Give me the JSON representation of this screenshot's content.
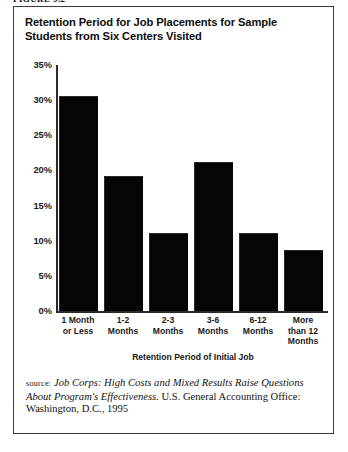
{
  "figure": {
    "label": "Figure 9.2"
  },
  "chart_title_line1": "Retention Period for Job Placements for Sample Students from",
  "chart_title_line2": "Six Centers Visited",
  "source": {
    "prefix": "source:",
    "italic_title": "Job Corps: High Costs and Mixed Results Raise Questions About Program's Effectiveness.",
    "rest": " U.S. General Accounting Office: Washington, D.C., 1995"
  },
  "colors": {
    "bar": "#050505",
    "axis": "#2b2b2b",
    "frame": "#3a3a3a",
    "text": "#111111",
    "background": "#ffffff"
  },
  "chart_data": {
    "type": "bar",
    "title": "Retention Period for Job Placements for Sample Students from Six Centers Visited",
    "xlabel": "Retention Period of Initial Job",
    "ylabel": "",
    "grid": false,
    "legend": "none",
    "ylim": [
      0,
      35
    ],
    "ytick_values": [
      0,
      5,
      10,
      15,
      20,
      25,
      30,
      35
    ],
    "ytick_labels": [
      "0%",
      "5%",
      "10%",
      "15%",
      "20%",
      "25%",
      "30%",
      "35%"
    ],
    "categories": [
      "1 Month\nor Less",
      "1-2\nMonths",
      "2-3\nMonths",
      "3-6\nMonths",
      "6-12\nMonths",
      "More\nthan 12\nMonths"
    ],
    "category_lines": [
      [
        "1 Month",
        "or Less"
      ],
      [
        "1-2",
        "Months"
      ],
      [
        "2-3",
        "Months"
      ],
      [
        "3-6",
        "Months"
      ],
      [
        "6-12",
        "Months"
      ],
      [
        "More",
        "than 12",
        "Months"
      ]
    ],
    "values": [
      30.5,
      19.0,
      11.0,
      21.0,
      11.0,
      8.5
    ],
    "value_unit": "%"
  }
}
